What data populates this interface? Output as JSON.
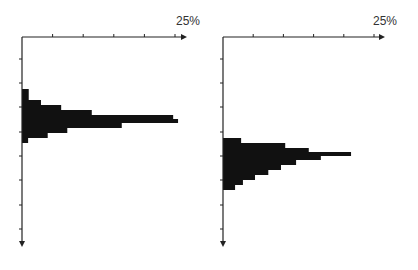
{
  "colors": {
    "bar": "#111111",
    "axis": "#222222",
    "background": "#ffffff"
  },
  "chart_data": [
    {
      "type": "bar",
      "orientation": "horizontal",
      "title": "",
      "xlabel": "",
      "ylabel": "",
      "axis_max_label": "25%",
      "xlim": [
        0,
        27
      ],
      "x_ticks": [
        5,
        10,
        15,
        20,
        25
      ],
      "y_ticks_count": 8,
      "grid": false,
      "legend": null,
      "values": [
        1.1,
        3.1,
        6.4,
        11.4,
        24.7,
        25.5,
        16.3,
        7.4,
        4.2,
        1.0
      ],
      "bins_y_start": [
        89,
        100,
        105,
        110,
        115,
        119,
        123,
        128,
        133,
        138
      ],
      "bins_y_end": [
        100,
        105,
        110,
        115,
        119,
        123,
        128,
        133,
        138,
        143
      ]
    },
    {
      "type": "bar",
      "orientation": "horizontal",
      "title": "",
      "xlabel": "",
      "ylabel": "",
      "axis_max_label": "25%",
      "xlim": [
        0,
        27
      ],
      "x_ticks": [
        5,
        10,
        15,
        20,
        25
      ],
      "y_ticks_count": 8,
      "grid": false,
      "legend": null,
      "values": [
        3.0,
        10.3,
        14.2,
        21.2,
        16.2,
        12.1,
        9.6,
        7.5,
        5.3,
        3.3,
        2.0
      ],
      "bins_y_start": [
        138,
        143,
        148,
        152,
        156,
        160,
        165,
        170,
        175,
        180,
        185
      ],
      "bins_y_end": [
        143,
        148,
        152,
        156,
        160,
        165,
        170,
        175,
        180,
        185,
        190
      ]
    }
  ],
  "layout": [
    {
      "origin_x": 22,
      "axis_y": 37,
      "tick_end_x": 175,
      "arrow_x": 187,
      "bottom_y": 247,
      "label_x": 176,
      "y_ticks": [
        59,
        83,
        107,
        132,
        156,
        180,
        205,
        229
      ]
    },
    {
      "origin_x": 223,
      "axis_y": 37,
      "tick_end_x": 374,
      "arrow_x": 385,
      "bottom_y": 247,
      "label_x": 373,
      "y_ticks": [
        59,
        83,
        107,
        132,
        156,
        180,
        205,
        229
      ]
    }
  ]
}
